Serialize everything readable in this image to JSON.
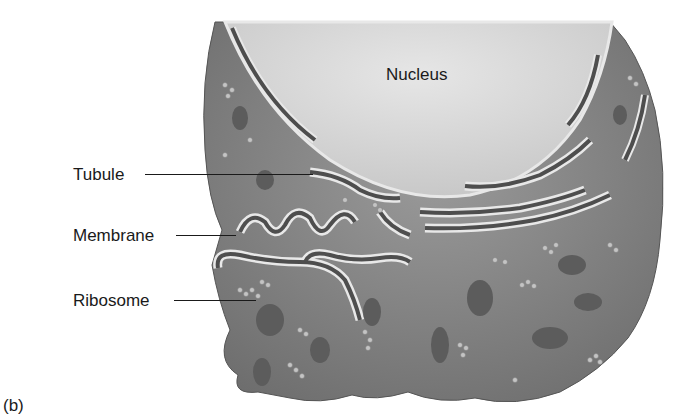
{
  "figure": {
    "panel_label": "(b)",
    "colors": {
      "cytoplasm": "#8f8f8f",
      "cytoplasm_dark": "#6a6a6a",
      "nucleus": "#d9d9d9",
      "membrane_highlight": "#e8e8e8",
      "lumen": "#5a5a5a",
      "ribosome": "#bdbdbd",
      "label_text": "#1a1a1a"
    },
    "labels": {
      "nucleus": "Nucleus",
      "tubule": "Tubule",
      "membrane": "Membrane",
      "ribosome": "Ribosome"
    }
  }
}
